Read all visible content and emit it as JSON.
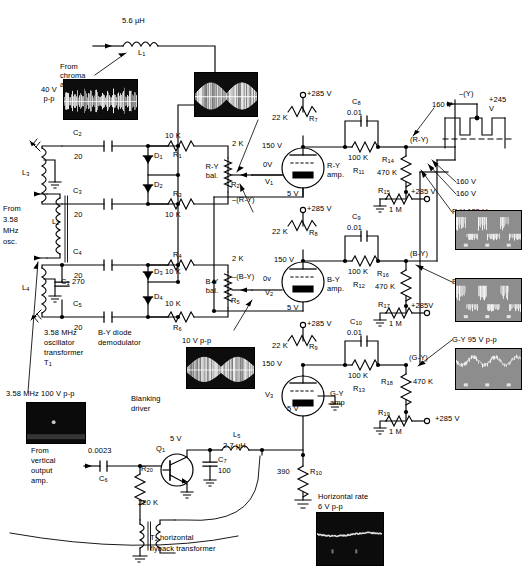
{
  "labels": {
    "l1_val": "5.6 µH",
    "l1_ref": "L1",
    "from_chroma": "From\nchroma\namp",
    "scope_chroma_v": "40 V\np-p",
    "c2_ref": "C2",
    "c2_val": "20",
    "c3_ref": "C3",
    "c3_val": "20",
    "c4_ref": "C4",
    "c4_val": "20",
    "c5_ref": "C5",
    "c5_val": "20",
    "c1_val": "C1 = 270",
    "l3_ref": "L3",
    "l4_ref": "L4",
    "l2_ref": "L2",
    "from_osc": "From\n3.58\nMHz\nosc.",
    "d1": "D1",
    "d2": "D2",
    "d3": "D3",
    "d4": "D4",
    "r1_val": "10 K",
    "r1_ref": "R1",
    "r3_ref": "R3",
    "r3_val": "10 K",
    "r4_ref": "R4",
    "r4_val": "10 K",
    "r6_val": "10 K",
    "r6_ref": "R6",
    "r2_val": "2 K",
    "r2_ref": "R2",
    "ry_bal": "R-Y\nbal.",
    "r5_val": "2 K",
    "r5_ref": "R5",
    "by_bal": "B-Y\nbal.",
    "osc_xfmr": "3.58 MHz\noscillator\ntransformer\nT1",
    "by_demod": "B-Y diode\ndemodulator",
    "scope_358_cap": "3.58 MHz 100 V p-p",
    "scope_10vpp_top": "10 V p-p",
    "scope_10vpp_bot": "10 V p-p",
    "neg_ry": "–(R-Y)",
    "neg_by": "–(B-Y)",
    "v285_1": "+285 V",
    "v285_2": "+285 V",
    "v285_3": "+285 V",
    "r7_val": "22 K",
    "r7_ref": "R7",
    "r8_val": "22 K",
    "r8_ref": "R8",
    "r9_val": "22 K",
    "r9_ref": "R9",
    "v150_1": "150 V",
    "v150_2": "150 V",
    "v150_3": "150 V",
    "v0_1": "0V",
    "v0_2": "0v",
    "v5_1": "5 V",
    "v5_2": "5 V",
    "v5_3": "5 V",
    "v1_ref": "V1",
    "v2_ref": "V2",
    "v3_ref": "V3",
    "ry_amp": "R-Y\namp.",
    "by_amp": "B-Y\namp.",
    "gy_amp": "G-Y\namp",
    "c8_ref": "C8",
    "c8_val": "0.01",
    "c9_ref": "C9",
    "c9_val": "0.01",
    "c10_ref": "C10",
    "c10_val": "0.01",
    "r11_val": "100 K",
    "r11_ref": "R11",
    "r12_val": "100 K",
    "r12_ref": "R12",
    "r13_val": "100 K",
    "r13_ref": "R13",
    "r14_ref": "R14",
    "r14_val": "470 K",
    "r16_ref": "R16",
    "r16_val": "470 K",
    "r18_ref": "R18",
    "r18_val": "470 K",
    "r15_ref": "R15",
    "r15_val": "1 M",
    "r15_v": "+285 V",
    "r17_ref": "R17",
    "r17_val": "1 M",
    "r17_v": "+285V",
    "r19_ref": "R19",
    "r19_val": "1 M",
    "r19_v": "+285 V",
    "ry_node": "(R-Y)",
    "by_node": "(B-Y)",
    "gy_node": "(G-Y)",
    "v160_a": "160 V",
    "v160_b": "160 V",
    "v160_c": "160 V",
    "neg_y": "–(Y)",
    "v245": "+245\nV",
    "cap_ry": "R-Y 135 V p-p",
    "cap_by": "B-Y 135 V p-p",
    "cap_gy": "G-Y 95 V p-p",
    "blanking": "Blanking\ndriver",
    "from_vert": "From\nvertical\noutput\namp.",
    "c6_val": "0.0023",
    "c6_ref": "C6",
    "q1_ref": "Q1",
    "q1_v": "5 V",
    "r20_ref": "R20",
    "r20_val": "220 K",
    "l5_ref": "L5",
    "l5_val": "2.7 µH",
    "c7_ref": "C7",
    "c7_val": "100",
    "t2_cap": "T2 horizontal\nflyback transformer",
    "r10_val": "390",
    "r10_ref": "R10",
    "horiz_cap": "Horizontal rate\n6 V p-p"
  },
  "colors": {
    "ink": "#000000",
    "paper": "#ffffff",
    "scope_dark": "#111111",
    "scope_gray": "#8a8a8a",
    "trace": "#f2f2f2"
  },
  "scopes": [
    {
      "name": "chroma-waveform",
      "kind": "dark-burst"
    },
    {
      "name": "ry-input-waveform",
      "kind": "dark-burst"
    },
    {
      "name": "by-input-waveform",
      "kind": "dark-burst"
    },
    {
      "name": "osc-358-waveform",
      "kind": "dark-dot"
    },
    {
      "name": "ry-output-waveform",
      "kind": "gray-bars"
    },
    {
      "name": "by-output-waveform",
      "kind": "gray-bars"
    },
    {
      "name": "gy-output-waveform",
      "kind": "gray-wave"
    },
    {
      "name": "horizontal-rate-waveform",
      "kind": "dark-line"
    }
  ]
}
